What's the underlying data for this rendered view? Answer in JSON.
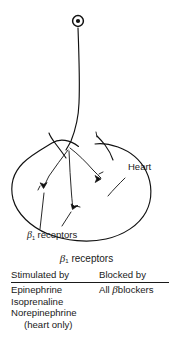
{
  "figure": {
    "line_color": "#111111",
    "background_color": "#ffffff"
  },
  "diagram": {
    "ganglion": {
      "name": "ganglion-symbol"
    },
    "organ_label": "Heart",
    "receptor_callout": {
      "symbol": "β",
      "subscript": "1",
      "text": "receptors"
    },
    "nerve_terminals_count": 3
  },
  "caption": {
    "symbol": "β",
    "subscript": "1",
    "text": "receptors"
  },
  "table": {
    "headers": {
      "stimulated": "Stimulated by",
      "blocked": "Blocked by"
    },
    "stimulated_by": [
      "Epinephrine",
      "Isoprenaline",
      "Norepinephrine",
      "(heart only)"
    ],
    "blocked_by_prefix": "All",
    "blocked_by_symbol": "β",
    "blocked_by_suffix": "blockers"
  }
}
